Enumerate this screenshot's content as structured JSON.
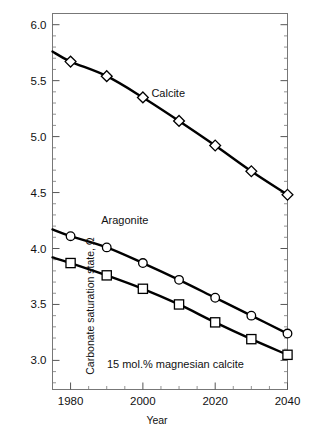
{
  "figure": {
    "kind": "scientific-line-chart",
    "background": "#ffffff",
    "line_color": "#000000",
    "marker_face": "#ffffff",
    "marker_edge": "#000000"
  },
  "chart_data": {
    "type": "line",
    "title": "",
    "xlabel": "Year",
    "ylabel": "Carbonate saturation state, Ω",
    "xlim": [
      1975,
      2040
    ],
    "ylim": [
      2.74,
      6.1
    ],
    "grid": false,
    "legend": "inline-annotations",
    "x_ticks_major": [
      1980,
      2000,
      2020,
      2040
    ],
    "x_tick_labels": [
      "1980",
      "2000",
      "2020",
      "2040"
    ],
    "x_ticks_minor": [
      1975,
      1985,
      1990,
      1995,
      2005,
      2010,
      2015,
      2025,
      2030,
      2035
    ],
    "y_ticks_major": [
      3.0,
      3.5,
      4.0,
      4.5,
      5.0,
      5.5,
      6.0
    ],
    "y_tick_labels": [
      "3.0",
      "3.5",
      "4.0",
      "4.5",
      "5.0",
      "5.5",
      "6.0"
    ],
    "y_minor_step": 0.1,
    "x": [
      1980,
      1990,
      2000,
      2010,
      2020,
      2030,
      2040
    ],
    "series": [
      {
        "name": "Calcite",
        "marker": "diamond",
        "values": [
          5.67,
          5.54,
          5.35,
          5.14,
          4.92,
          4.69,
          4.48
        ],
        "line_start": {
          "x": 1975,
          "y": 5.76
        },
        "annotation": {
          "text": "Calcite",
          "x": 2007,
          "y": 5.38
        }
      },
      {
        "name": "Aragonite",
        "marker": "circle",
        "values": [
          4.11,
          4.01,
          3.87,
          3.72,
          3.56,
          3.4,
          3.24
        ],
        "line_start": {
          "x": 1975,
          "y": 4.17
        },
        "annotation": {
          "text": "Aragonite",
          "x": 1995,
          "y": 4.25
        }
      },
      {
        "name": "15 mol.% magnesian calcite",
        "marker": "square",
        "values": [
          3.87,
          3.76,
          3.64,
          3.5,
          3.34,
          3.19,
          3.05
        ],
        "line_start": {
          "x": 1975,
          "y": 3.92
        },
        "annotation": {
          "text": "15 mol.% magnesian calcite",
          "x": 2009,
          "y": 2.96
        }
      }
    ]
  },
  "annotations": {
    "calcite": "Calcite",
    "aragonite": "Aragonite",
    "mgcalcite": "15 mol.% magnesian calcite"
  },
  "axis_labels": {
    "x": "Year",
    "y": "Carbonate saturation state, Ω"
  }
}
